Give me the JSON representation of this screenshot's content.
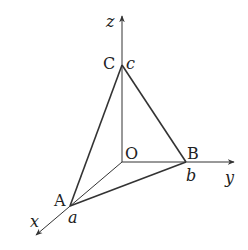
{
  "diagram": {
    "type": "3d-coordinate-tetrahedron",
    "axes": {
      "x_label": "x",
      "y_label": "y",
      "z_label": "z"
    },
    "points": {
      "origin": {
        "label": "O"
      },
      "A": {
        "label": "A",
        "value_label": "a",
        "on_axis": "x"
      },
      "B": {
        "label": "B",
        "value_label": "b",
        "on_axis": "y"
      },
      "C": {
        "label": "C",
        "value_label": "c",
        "on_axis": "z"
      }
    },
    "edges": [
      "AB",
      "BC",
      "CA",
      "OA",
      "OB",
      "OC"
    ],
    "colors": {
      "line": "#333333",
      "text": "#222222",
      "background": "#ffffff"
    }
  }
}
